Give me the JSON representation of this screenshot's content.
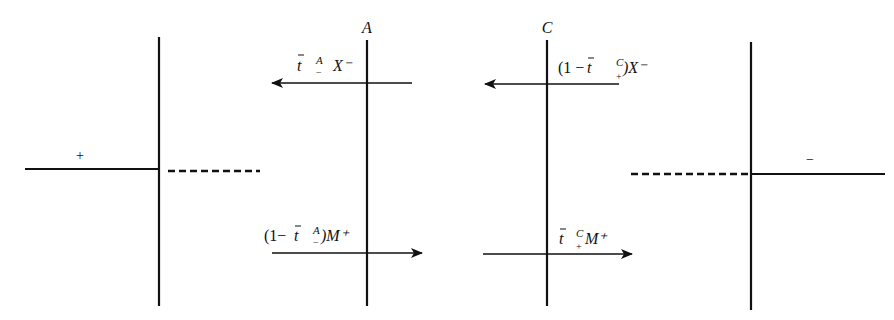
{
  "diagram": {
    "left_panel": {
      "sign_label": "+"
    },
    "right_panel": {
      "sign_label": "−"
    },
    "panel_a": {
      "title": "A",
      "upper_arrow": {
        "direction": "left",
        "label": {
          "t": "t",
          "sup": "A",
          "sub": "−",
          "tail": "X⁻"
        }
      },
      "lower_arrow": {
        "direction": "right",
        "label": {
          "prefix": "(1−",
          "t": "t",
          "sup": "A",
          "sub": "−",
          "tail": ")M⁺"
        }
      }
    },
    "panel_c": {
      "title": "C",
      "upper_arrow": {
        "direction": "left",
        "label": {
          "prefix": "(1 − ",
          "t": "t",
          "sup": "C",
          "sub": "+",
          "tail": ")X⁻"
        }
      },
      "lower_arrow": {
        "direction": "right",
        "label": {
          "t": "t",
          "sup": "C",
          "sub": "+",
          "tail": "M⁺"
        }
      }
    }
  }
}
